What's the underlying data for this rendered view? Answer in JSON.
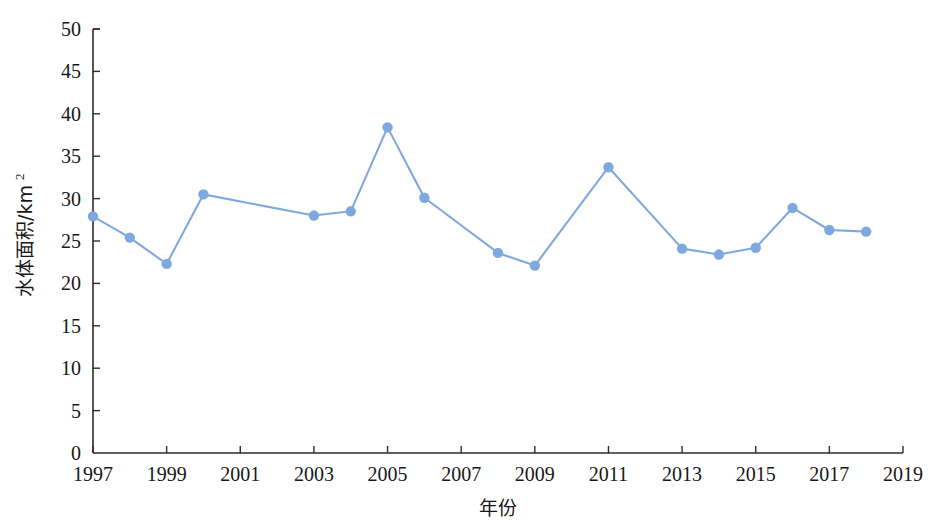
{
  "chart_data": {
    "type": "line",
    "title": "",
    "xlabel": "年份",
    "ylabel": "水体面积/km",
    "ylabel_superscript": "2",
    "xlim": [
      1997,
      2019
    ],
    "ylim": [
      0,
      50
    ],
    "grid": false,
    "legend": null,
    "series_color": "#7FA9DE",
    "x_tick_labels": [
      "1997",
      "1999",
      "2001",
      "2003",
      "2005",
      "2007",
      "2009",
      "2011",
      "2013",
      "2015",
      "2017",
      "2019"
    ],
    "x_tick_values": [
      1997,
      1999,
      2001,
      2003,
      2005,
      2007,
      2009,
      2011,
      2013,
      2015,
      2017,
      2019
    ],
    "y_tick_labels": [
      "0",
      "5",
      "10",
      "15",
      "20",
      "25",
      "30",
      "35",
      "40",
      "45",
      "50"
    ],
    "y_tick_values": [
      0,
      5,
      10,
      15,
      20,
      25,
      30,
      35,
      40,
      45,
      50
    ],
    "x": [
      1997,
      1998,
      1999,
      2000,
      2003,
      2004,
      2005,
      2006,
      2008,
      2009,
      2011,
      2013,
      2014,
      2015,
      2016,
      2017,
      2018
    ],
    "values": [
      27.9,
      25.4,
      22.3,
      30.5,
      28.0,
      28.5,
      38.4,
      30.1,
      23.6,
      22.1,
      33.7,
      24.1,
      23.4,
      24.2,
      28.9,
      26.3,
      26.1
    ],
    "series": [
      {
        "name": "水体面积",
        "points": [
          {
            "x": 1997,
            "y": 27.9
          },
          {
            "x": 1998,
            "y": 25.4
          },
          {
            "x": 1999,
            "y": 22.3
          },
          {
            "x": 2000,
            "y": 30.5
          },
          {
            "x": 2003,
            "y": 28.0
          },
          {
            "x": 2004,
            "y": 28.5
          },
          {
            "x": 2005,
            "y": 38.4
          },
          {
            "x": 2006,
            "y": 30.1
          },
          {
            "x": 2008,
            "y": 23.6
          },
          {
            "x": 2009,
            "y": 22.1
          },
          {
            "x": 2011,
            "y": 33.7
          },
          {
            "x": 2013,
            "y": 24.1
          },
          {
            "x": 2014,
            "y": 23.4
          },
          {
            "x": 2015,
            "y": 24.2
          },
          {
            "x": 2016,
            "y": 28.9
          },
          {
            "x": 2017,
            "y": 26.3
          },
          {
            "x": 2018,
            "y": 26.1
          }
        ]
      }
    ]
  }
}
